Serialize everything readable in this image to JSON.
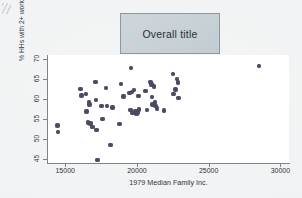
{
  "figure": {
    "background_color": "#f0f2f3",
    "title_box": {
      "text": "Overall title",
      "fill_color": "#c9d2d7",
      "border_color": "#8d979c"
    },
    "plot_background": "#ffffff",
    "marker_color": "#4b4c64",
    "axis_color": "#7d858b"
  },
  "chart_data": {
    "type": "scatter",
    "title": "Overall title",
    "xlabel": "1979 Median Family Inc.",
    "ylabel": "% HHs with 2+ workers",
    "xlim": [
      13800,
      30600
    ],
    "ylim": [
      44,
      71
    ],
    "xticks": [
      15000,
      20000,
      25000,
      30000
    ],
    "xtick_labels": [
      "15000",
      "20000",
      "25000",
      "30000"
    ],
    "yticks": [
      45,
      50,
      55,
      60,
      65,
      70
    ],
    "ytick_labels": [
      "45",
      "50",
      "55",
      "60",
      "65",
      "70"
    ],
    "grid": false,
    "legend": false,
    "marker": "filled-circle",
    "points": [
      {
        "x": 14450,
        "y": 53.4
      },
      {
        "x": 14500,
        "y": 51.8
      },
      {
        "x": 16050,
        "y": 62.5
      },
      {
        "x": 16150,
        "y": 60.9
      },
      {
        "x": 16450,
        "y": 61.2
      },
      {
        "x": 16500,
        "y": 56.9
      },
      {
        "x": 16600,
        "y": 54.1
      },
      {
        "x": 16650,
        "y": 59.3
      },
      {
        "x": 16700,
        "y": 58.6
      },
      {
        "x": 16750,
        "y": 53.9
      },
      {
        "x": 16900,
        "y": 53.0
      },
      {
        "x": 17100,
        "y": 64.3
      },
      {
        "x": 17150,
        "y": 59.7
      },
      {
        "x": 17200,
        "y": 52.2
      },
      {
        "x": 17250,
        "y": 44.8
      },
      {
        "x": 17550,
        "y": 58.2
      },
      {
        "x": 17600,
        "y": 55.0
      },
      {
        "x": 17850,
        "y": 62.7
      },
      {
        "x": 17900,
        "y": 58.3
      },
      {
        "x": 18150,
        "y": 48.5
      },
      {
        "x": 18300,
        "y": 57.9
      },
      {
        "x": 18800,
        "y": 53.8
      },
      {
        "x": 18900,
        "y": 63.8
      },
      {
        "x": 19050,
        "y": 60.6
      },
      {
        "x": 19500,
        "y": 61.5
      },
      {
        "x": 19550,
        "y": 57.3
      },
      {
        "x": 19600,
        "y": 67.8
      },
      {
        "x": 19650,
        "y": 61.8
      },
      {
        "x": 19700,
        "y": 56.5
      },
      {
        "x": 19800,
        "y": 62.2
      },
      {
        "x": 19900,
        "y": 57.0
      },
      {
        "x": 19950,
        "y": 56.3
      },
      {
        "x": 20050,
        "y": 56.6
      },
      {
        "x": 20100,
        "y": 60.8
      },
      {
        "x": 20150,
        "y": 57.4
      },
      {
        "x": 20600,
        "y": 62.0
      },
      {
        "x": 20700,
        "y": 57.2
      },
      {
        "x": 20950,
        "y": 64.2
      },
      {
        "x": 21000,
        "y": 63.6
      },
      {
        "x": 21050,
        "y": 60.5
      },
      {
        "x": 21100,
        "y": 58.6
      },
      {
        "x": 21200,
        "y": 63.1
      },
      {
        "x": 21250,
        "y": 59.1
      },
      {
        "x": 21300,
        "y": 58.2
      },
      {
        "x": 21400,
        "y": 57.6
      },
      {
        "x": 21900,
        "y": 57.1
      },
      {
        "x": 22500,
        "y": 66.3
      },
      {
        "x": 22550,
        "y": 61.3
      },
      {
        "x": 22700,
        "y": 62.4
      },
      {
        "x": 22800,
        "y": 65.0
      },
      {
        "x": 22850,
        "y": 64.1
      },
      {
        "x": 22900,
        "y": 60.3
      },
      {
        "x": 28500,
        "y": 68.2
      }
    ]
  }
}
